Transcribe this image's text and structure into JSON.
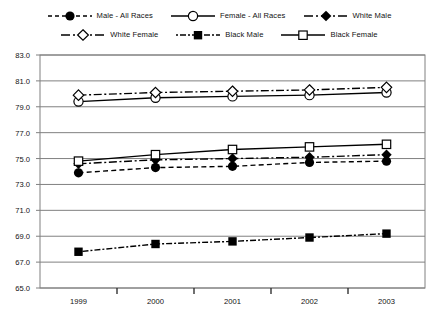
{
  "chart_data": {
    "type": "line",
    "title": "",
    "subtitle": "",
    "xlabel": "",
    "ylabel": "",
    "categories": [
      "1999",
      "2000",
      "2001",
      "2002",
      "2003"
    ],
    "ylim": [
      65.0,
      83.0
    ],
    "ytick_step": 2.0,
    "yticks": [
      "83.0",
      "81.0",
      "79.0",
      "77.0",
      "75.0",
      "73.0",
      "71.0",
      "69.0",
      "67.0",
      "65.0"
    ],
    "ytick_values": [
      83.0,
      81.0,
      79.0,
      77.0,
      75.0,
      73.0,
      71.0,
      69.0,
      67.0,
      65.0
    ],
    "grid": true,
    "grid_axis": "y",
    "legend_position": "top",
    "series": [
      {
        "name": "Male - All Races",
        "marker": "filled-circle",
        "line": "dashed",
        "color": "#000000",
        "values": [
          73.9,
          74.3,
          74.4,
          74.7,
          74.8
        ]
      },
      {
        "name": "Female - All Races",
        "marker": "open-circle",
        "line": "solid",
        "color": "#000000",
        "values": [
          79.4,
          79.7,
          79.8,
          79.9,
          80.1
        ]
      },
      {
        "name": "White Male",
        "marker": "filled-diamond",
        "line": "dash-dot",
        "color": "#000000",
        "values": [
          74.6,
          74.9,
          75.0,
          75.1,
          75.3
        ]
      },
      {
        "name": "White Female",
        "marker": "open-diamond",
        "line": "dash-dot",
        "color": "#000000",
        "values": [
          79.9,
          80.1,
          80.2,
          80.3,
          80.5
        ]
      },
      {
        "name": "Black Male",
        "marker": "filled-square",
        "line": "dash-dot-dot",
        "color": "#000000",
        "values": [
          67.8,
          68.4,
          68.6,
          68.9,
          69.2
        ]
      },
      {
        "name": "Black Female",
        "marker": "open-square",
        "line": "solid",
        "color": "#000000",
        "values": [
          74.8,
          75.3,
          75.7,
          75.9,
          76.1
        ]
      }
    ]
  },
  "legend": {
    "rows": [
      [
        "Male - All Races",
        "Female - All Races",
        "White Male"
      ],
      [
        "White Female",
        "Black Male",
        "Black Female"
      ]
    ]
  },
  "axis": {
    "line_color": "#808080",
    "grid_color": "#808080",
    "text_color": "#111111"
  }
}
